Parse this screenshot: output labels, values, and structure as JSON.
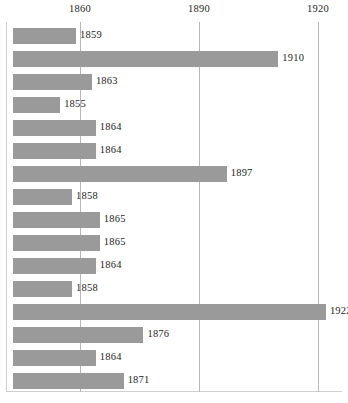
{
  "chart_data": {
    "type": "bar",
    "orientation": "horizontal",
    "title": "",
    "subtitle": "",
    "xlabel": "",
    "ylabel": "",
    "categories": [
      "",
      "",
      "",
      "",
      "",
      "",
      "",
      "",
      "",
      "",
      "",
      "",
      "",
      "",
      "",
      ""
    ],
    "values": [
      1859,
      1910,
      1863,
      1855,
      1864,
      1864,
      1897,
      1858,
      1865,
      1865,
      1864,
      1858,
      1922,
      1876,
      1864,
      1871
    ],
    "data_labels": [
      "1859",
      "1910",
      "1863",
      "1855",
      "1864",
      "1864",
      "1897",
      "1858",
      "1865",
      "1865",
      "1864",
      "1858",
      "1922",
      "1876",
      "1864",
      "1871"
    ],
    "xlim": [
      1845,
      1928
    ],
    "bar_baseline": 1845,
    "xticks": [
      1860,
      1890,
      1920
    ],
    "xtick_labels": [
      "1860",
      "1890",
      "1920"
    ],
    "yticks": [],
    "ytick_labels": [],
    "grid": "vertical-only",
    "legend": null,
    "legend_position": "none",
    "series": [
      {
        "name": "",
        "values": [
          1859,
          1910,
          1863,
          1855,
          1864,
          1864,
          1897,
          1858,
          1865,
          1865,
          1864,
          1858,
          1922,
          1876,
          1864,
          1871
        ]
      }
    ],
    "annotations": []
  },
  "colors": {
    "bar_fill": "#9a9a9a",
    "gridline": "#b8b8b8",
    "axis_frame": "#cfcfcf",
    "label_text": "#262626",
    "background": "#ffffff"
  }
}
